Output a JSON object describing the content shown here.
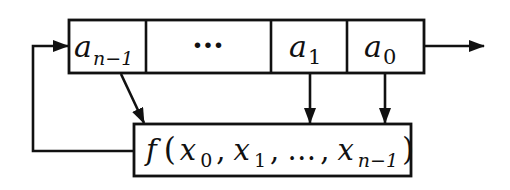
{
  "diagram": {
    "type": "feedback shift register",
    "register_cells": [
      {
        "base": "a",
        "sub": "n−1"
      },
      {
        "text": "···"
      },
      {
        "base": "a",
        "sub": "1"
      },
      {
        "base": "a",
        "sub": "0"
      }
    ],
    "function_box": {
      "f": "f",
      "open": "(",
      "args": [
        {
          "base": "x",
          "sub": "0"
        },
        {
          "base": "x",
          "sub": "1"
        },
        {
          "text": "…"
        },
        {
          "base": "x",
          "sub": "n−1"
        }
      ],
      "close": ")"
    },
    "edges": [
      {
        "from": "cell-a-n-1",
        "to": "function-box"
      },
      {
        "from": "cell-a-1",
        "to": "function-box"
      },
      {
        "from": "cell-a-0",
        "to": "function-box"
      },
      {
        "from": "function-box",
        "to": "cell-a-n-1",
        "label": "feedback"
      },
      {
        "from": "cell-a-0",
        "to": "output"
      }
    ]
  }
}
